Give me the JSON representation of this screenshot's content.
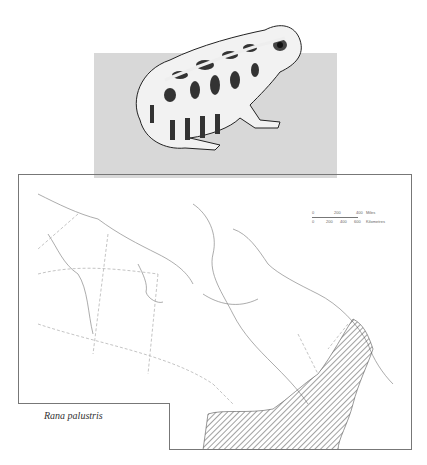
{
  "illustration": {
    "subject": "frog-illustration",
    "background_color": "#d8d8d8"
  },
  "map": {
    "region": "Canada",
    "species_label": "Rana palustris",
    "range_fill": "hatched",
    "scale": {
      "miles": {
        "ticks": [
          "0",
          "200",
          "400"
        ],
        "unit": "Miles"
      },
      "kilometres": {
        "ticks": [
          "0",
          "200",
          "400",
          "600"
        ],
        "unit": "Kilometres"
      }
    }
  }
}
